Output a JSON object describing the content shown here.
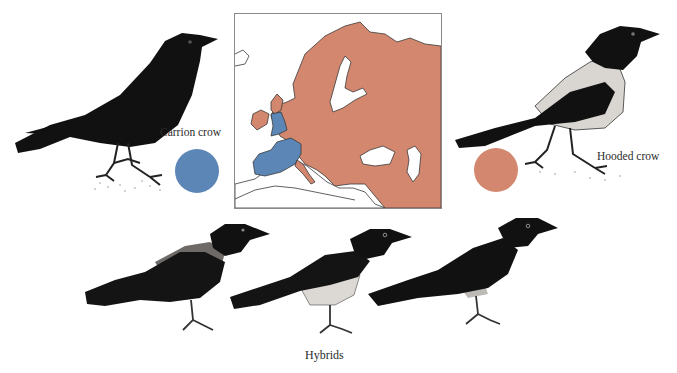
{
  "figure": {
    "colors": {
      "carrion": "#5b86b5",
      "hooded": "#d4876f",
      "map_outline": "#3a3a3a",
      "bird_ink": "#111111",
      "hood_grey": "#d9d6d2"
    },
    "species": [
      {
        "id": "carrion",
        "label": "Carrion crow",
        "color_key": "carrion"
      },
      {
        "id": "hooded",
        "label": "Hooded crow",
        "color_key": "hooded"
      }
    ],
    "hybrids_label": "Hybrids",
    "map": {
      "region": "Europe",
      "legend": [
        {
          "range": "Carrion crow range",
          "areas": [
            "Great Britain (England, Wales, S. Scotland)",
            "France",
            "Iberia",
            "Western Central Europe"
          ],
          "color_key": "carrion"
        },
        {
          "range": "Hooded crow range",
          "areas": [
            "Ireland",
            "N. Scotland",
            "Scandinavia",
            "Eastern & Central Europe",
            "Italy",
            "Balkans",
            "Russia",
            "Middle East"
          ],
          "color_key": "hooded"
        }
      ]
    }
  }
}
